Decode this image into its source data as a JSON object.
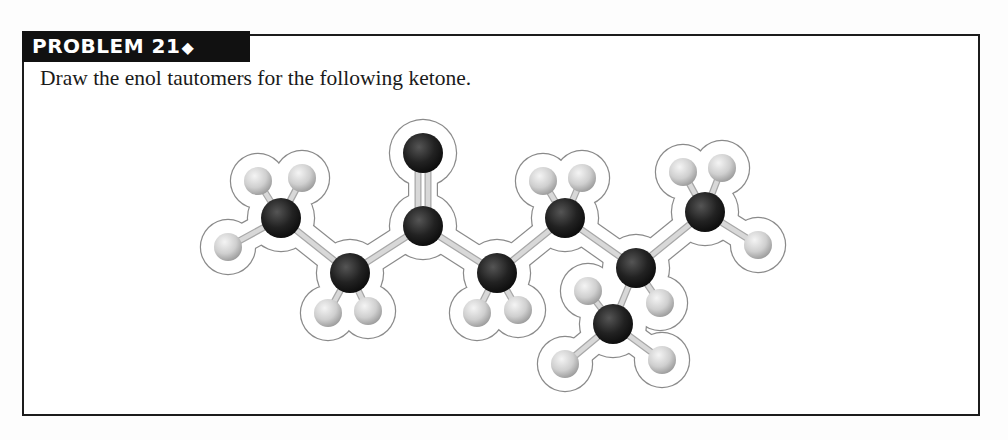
{
  "problem": {
    "label": "PROBLEM 21",
    "marker": "◆",
    "instruction": "Draw the enol tautomers for the following ketone."
  },
  "figure": {
    "colors": {
      "carbon": "#1f1f1f",
      "oxygen": "#1f1f1f",
      "hydrogen": "#c9c9c9",
      "bond": "#d8d8d8",
      "outline": "#8a8a8a"
    },
    "atoms": [
      {
        "id": "C1",
        "el": "C",
        "x": 281,
        "y": 218
      },
      {
        "id": "C2",
        "el": "C",
        "x": 350,
        "y": 273
      },
      {
        "id": "C3",
        "el": "C",
        "x": 423,
        "y": 226
      },
      {
        "id": "O",
        "el": "O",
        "x": 423,
        "y": 153
      },
      {
        "id": "C4",
        "el": "C",
        "x": 497,
        "y": 273
      },
      {
        "id": "C5",
        "el": "C",
        "x": 565,
        "y": 218
      },
      {
        "id": "C6",
        "el": "C",
        "x": 636,
        "y": 268
      },
      {
        "id": "C7",
        "el": "C",
        "x": 613,
        "y": 324
      },
      {
        "id": "C8",
        "el": "C",
        "x": 705,
        "y": 212
      },
      {
        "id": "H1a",
        "el": "H",
        "x": 258,
        "y": 181
      },
      {
        "id": "H1b",
        "el": "H",
        "x": 302,
        "y": 178
      },
      {
        "id": "H1c",
        "el": "H",
        "x": 228,
        "y": 247
      },
      {
        "id": "H2a",
        "el": "H",
        "x": 328,
        "y": 313
      },
      {
        "id": "H2b",
        "el": "H",
        "x": 368,
        "y": 311
      },
      {
        "id": "H4a",
        "el": "H",
        "x": 477,
        "y": 313
      },
      {
        "id": "H4b",
        "el": "H",
        "x": 518,
        "y": 310
      },
      {
        "id": "H5a",
        "el": "H",
        "x": 543,
        "y": 181
      },
      {
        "id": "H5b",
        "el": "H",
        "x": 582,
        "y": 178
      },
      {
        "id": "H6",
        "el": "H",
        "x": 660,
        "y": 303
      },
      {
        "id": "H7a",
        "el": "H",
        "x": 588,
        "y": 291
      },
      {
        "id": "H7b",
        "el": "H",
        "x": 565,
        "y": 364
      },
      {
        "id": "H7c",
        "el": "H",
        "x": 662,
        "y": 360
      },
      {
        "id": "H8a",
        "el": "H",
        "x": 683,
        "y": 172
      },
      {
        "id": "H8b",
        "el": "H",
        "x": 722,
        "y": 168
      },
      {
        "id": "H8c",
        "el": "H",
        "x": 758,
        "y": 245
      }
    ],
    "bonds": [
      [
        "C1",
        "C2",
        1
      ],
      [
        "C2",
        "C3",
        1
      ],
      [
        "C3",
        "O",
        2
      ],
      [
        "C3",
        "C4",
        1
      ],
      [
        "C4",
        "C5",
        1
      ],
      [
        "C5",
        "C6",
        1
      ],
      [
        "C6",
        "C7",
        1
      ],
      [
        "C6",
        "C8",
        1
      ],
      [
        "C1",
        "H1a",
        1
      ],
      [
        "C1",
        "H1b",
        1
      ],
      [
        "C1",
        "H1c",
        1
      ],
      [
        "C2",
        "H2a",
        1
      ],
      [
        "C2",
        "H2b",
        1
      ],
      [
        "C4",
        "H4a",
        1
      ],
      [
        "C4",
        "H4b",
        1
      ],
      [
        "C5",
        "H5a",
        1
      ],
      [
        "C5",
        "H5b",
        1
      ],
      [
        "C6",
        "H6",
        1
      ],
      [
        "C7",
        "H7a",
        1
      ],
      [
        "C7",
        "H7b",
        1
      ],
      [
        "C7",
        "H7c",
        1
      ],
      [
        "C8",
        "H8a",
        1
      ],
      [
        "C8",
        "H8b",
        1
      ],
      [
        "C8",
        "H8c",
        1
      ]
    ]
  }
}
